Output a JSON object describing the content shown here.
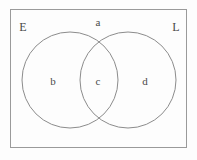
{
  "diagram": {
    "type": "venn-two-set",
    "title": "",
    "universe": {
      "name": "universal-set-box",
      "border_color": "#9a9a9a",
      "fill_color": "#fdfdfd"
    },
    "sets": [
      {
        "id": "E",
        "label": "E",
        "label_position": "top-left",
        "circle": {
          "cx": 70,
          "cy": 80,
          "r": 48
        },
        "stroke_color": "#8c8c8c"
      },
      {
        "id": "L",
        "label": "L",
        "label_position": "top-right",
        "circle": {
          "cx": 128,
          "cy": 80,
          "r": 48
        },
        "stroke_color": "#8c8c8c"
      }
    ],
    "regions": [
      {
        "id": "a",
        "label": "a",
        "description": "outside-both-circles",
        "x": 98,
        "y": 22
      },
      {
        "id": "b",
        "label": "b",
        "description": "E-only",
        "x": 53,
        "y": 81
      },
      {
        "id": "c",
        "label": "c",
        "description": "E-intersect-L",
        "x": 98,
        "y": 81
      },
      {
        "id": "d",
        "label": "d",
        "description": "L-only",
        "x": 145,
        "y": 81
      }
    ],
    "set_label_positions": {
      "E": {
        "x": 23,
        "y": 27
      },
      "L": {
        "x": 176,
        "y": 27
      }
    },
    "colors": {
      "text": "#4a4a4a",
      "circle_stroke": "#8c8c8c",
      "box_stroke": "#9a9a9a",
      "background": "#fdfdfd"
    }
  }
}
